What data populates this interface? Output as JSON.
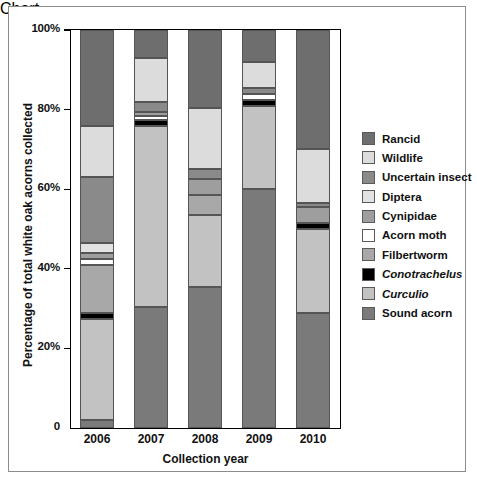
{
  "chart_data": {
    "type": "bar",
    "stacked": true,
    "title": "",
    "xlabel": "Collection year",
    "ylabel": "Percentage of total white oak acorns collected",
    "categories": [
      "2006",
      "2007",
      "2008",
      "2009",
      "2010"
    ],
    "ylim": [
      0,
      100
    ],
    "ytick_labels": [
      "0",
      "20%",
      "40%",
      "60%",
      "80%",
      "100%"
    ],
    "ytick_values": [
      0,
      20,
      40,
      60,
      80,
      100
    ],
    "grid": false,
    "legend_position": "right",
    "series": [
      {
        "name": "Sound acorn",
        "color": "#7a7a7a",
        "values": [
          2,
          30.5,
          35.5,
          60,
          29
        ]
      },
      {
        "name": "Curculio",
        "color": "#c2c2c2",
        "values": [
          25.5,
          45.5,
          18,
          21,
          21
        ]
      },
      {
        "name": "Conotrachelus",
        "color": "#000000",
        "values": [
          1.5,
          1.5,
          0,
          1.5,
          1.5
        ]
      },
      {
        "name": "Filbertworm",
        "color": "#a8a8a8",
        "values": [
          12,
          0,
          5,
          0,
          0
        ]
      },
      {
        "name": "Acorn moth",
        "color": "#ffffff",
        "values": [
          1.5,
          1,
          0,
          1.5,
          0
        ]
      },
      {
        "name": "Cynipidae",
        "color": "#9e9e9e",
        "values": [
          1.5,
          1,
          4,
          0,
          4
        ]
      },
      {
        "name": "Diptera",
        "color": "#e2e2e2",
        "values": [
          2.5,
          0,
          0,
          0,
          0
        ]
      },
      {
        "name": "Uncertain insect",
        "color": "#8a8a8a",
        "values": [
          16.5,
          2.5,
          2.5,
          1.5,
          1
        ]
      },
      {
        "name": "Wildlife",
        "color": "#dcdcdc",
        "values": [
          13,
          11,
          15.5,
          6.5,
          13.5
        ]
      },
      {
        "name": "Rancid",
        "color": "#6e6e6e",
        "values": [
          24,
          7,
          19.5,
          8,
          30
        ]
      }
    ]
  },
  "axis": {
    "ylabel": "Percentage of total white oak acorns collected",
    "xlabel": "Collection year",
    "yticks": [
      {
        "label": "100%",
        "value": 100
      },
      {
        "label": "80%",
        "value": 80
      },
      {
        "label": "60%",
        "value": 60
      },
      {
        "label": "40%",
        "value": 40
      },
      {
        "label": "20%",
        "value": 20
      },
      {
        "label": "0",
        "value": 0
      }
    ],
    "xticks": [
      "2006",
      "2007",
      "2008",
      "2009",
      "2010"
    ]
  },
  "legend": {
    "items": [
      {
        "label": "Rancid",
        "color": "#6e6e6e",
        "italic": false
      },
      {
        "label": "Wildlife",
        "color": "#dcdcdc",
        "italic": false
      },
      {
        "label": "Uncertain insect",
        "color": "#8a8a8a",
        "italic": false
      },
      {
        "label": "Diptera",
        "color": "#e2e2e2",
        "italic": false
      },
      {
        "label": "Cynipidae",
        "color": "#9e9e9e",
        "italic": false
      },
      {
        "label": "Acorn moth",
        "color": "#ffffff",
        "italic": false
      },
      {
        "label": "Filbertworm",
        "color": "#a8a8a8",
        "italic": false
      },
      {
        "label": "Conotrachelus",
        "color": "#000000",
        "italic": true
      },
      {
        "label": "Curculio",
        "color": "#c2c2c2",
        "italic": true
      },
      {
        "label": "Sound acorn",
        "color": "#7a7a7a",
        "italic": false
      }
    ]
  }
}
